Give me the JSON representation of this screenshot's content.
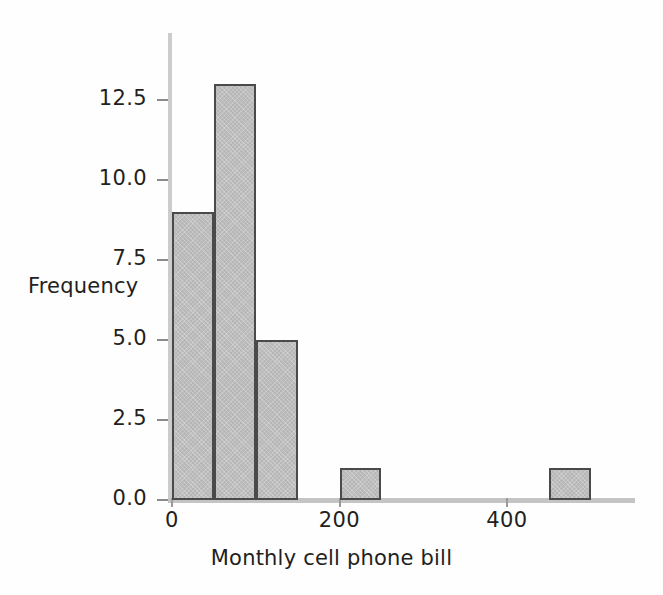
{
  "chart_data": {
    "type": "bar",
    "title": "",
    "xlabel": "Monthly cell phone bill",
    "ylabel": "Frequency",
    "bin_width": 50,
    "bin_edges": [
      0,
      50,
      100,
      150,
      200,
      250,
      300,
      350,
      400,
      450,
      500
    ],
    "categories": [
      "0-50",
      "50-100",
      "100-150",
      "150-200",
      "200-250",
      "250-300",
      "300-350",
      "350-400",
      "400-450",
      "450-500"
    ],
    "values": [
      9,
      13,
      5,
      0,
      1,
      0,
      0,
      0,
      0,
      1
    ],
    "bars": [
      {
        "x0": 0,
        "x1": 50,
        "value": 9
      },
      {
        "x0": 50,
        "x1": 100,
        "value": 13
      },
      {
        "x0": 100,
        "x1": 150,
        "value": 5
      },
      {
        "x0": 200,
        "x1": 250,
        "value": 1
      },
      {
        "x0": 450,
        "x1": 500,
        "value": 1
      }
    ],
    "xlim": [
      0,
      560
    ],
    "ylim": [
      0,
      14.6
    ],
    "xticks": [
      0,
      200,
      400
    ],
    "xtick_labels": [
      "0",
      "200",
      "400"
    ],
    "yticks": [
      0.0,
      2.5,
      5.0,
      7.5,
      10.0,
      12.5
    ],
    "ytick_labels": [
      "0.0",
      "2.5",
      "5.0",
      "7.5",
      "10.0",
      "12.5"
    ],
    "grid": false,
    "legend": null,
    "colors": {
      "bar_fill": "#b6b6b6",
      "bar_edge": "#4a4a4a",
      "axis": "#c4c4c4",
      "tick": "#8c8c8c",
      "text": "#231f20",
      "background": "#fefefe"
    }
  }
}
